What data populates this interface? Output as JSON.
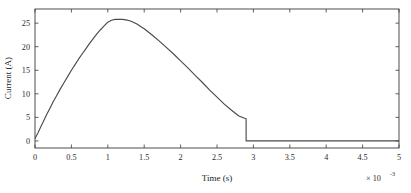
{
  "chart_data": {
    "type": "line",
    "title": "",
    "xlabel": "Time (s)",
    "ylabel": "Current (A)",
    "x_exponent_label": "× 10",
    "x_exponent_value": "-3",
    "xlim": [
      0,
      5
    ],
    "ylim": [
      -1.5,
      28
    ],
    "xticks": [
      0,
      0.5,
      1,
      1.5,
      2,
      2.5,
      3,
      3.5,
      4,
      4.5,
      5
    ],
    "xtick_labels": [
      "0",
      "0.5",
      "1",
      "1.5",
      "2",
      "2.5",
      "3",
      "3.5",
      "4",
      "4.5",
      "5"
    ],
    "yticks": [
      0,
      5,
      10,
      15,
      20,
      25
    ],
    "ytick_labels": [
      "0",
      "5",
      "10",
      "15",
      "20",
      "25"
    ],
    "grid": false,
    "legend": false,
    "box": true,
    "line_color": "#4a4a4a",
    "axis_color": "#3a3a3a",
    "background": "#ffffff",
    "series": [
      {
        "name": "Current",
        "x": [
          0,
          0.04,
          0.08,
          0.12,
          0.16,
          0.2,
          0.25,
          0.3,
          0.35,
          0.4,
          0.45,
          0.5,
          0.55,
          0.6,
          0.65,
          0.7,
          0.75,
          0.8,
          0.85,
          0.9,
          0.95,
          1.0,
          1.05,
          1.1,
          1.15,
          1.2,
          1.25,
          1.3,
          1.35,
          1.4,
          1.45,
          1.5,
          1.6,
          1.7,
          1.8,
          1.9,
          2.0,
          2.1,
          2.2,
          2.3,
          2.4,
          2.5,
          2.6,
          2.7,
          2.8,
          2.88,
          2.9,
          2.9,
          3.0,
          3.2,
          3.5,
          4.0,
          4.5,
          5.0
        ],
        "y": [
          0.5,
          1.7,
          3.0,
          4.3,
          5.6,
          6.8,
          8.3,
          9.7,
          11.1,
          12.4,
          13.7,
          15.0,
          16.2,
          17.4,
          18.5,
          19.6,
          20.7,
          21.7,
          22.7,
          23.6,
          24.4,
          25.2,
          25.6,
          25.8,
          25.8,
          25.8,
          25.7,
          25.5,
          25.2,
          24.8,
          24.3,
          23.8,
          22.6,
          21.3,
          19.9,
          18.5,
          17.0,
          15.5,
          13.9,
          12.4,
          10.8,
          9.3,
          7.8,
          6.5,
          5.3,
          4.8,
          4.7,
          0.0,
          0.0,
          0.0,
          0.0,
          0.0,
          0.0,
          0.0
        ],
        "peak_value": 25.8,
        "peak_time": 1.12,
        "cutoff_time": 2.9,
        "start_value": 0.5
      }
    ]
  },
  "figure": {
    "ylabel": "Current (A)",
    "xlabel": "Time (s)"
  }
}
